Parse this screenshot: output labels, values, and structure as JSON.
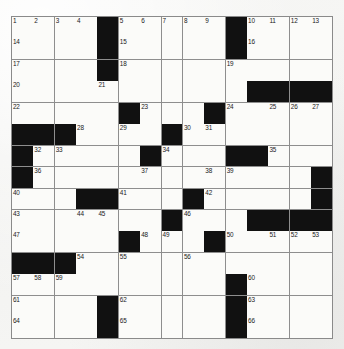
{
  "puzzle": {
    "title": "Crossword Puzzle Grid",
    "type": "american-crossword",
    "size": {
      "rows": 15,
      "cols": 15
    },
    "colors": {
      "block": "#111111",
      "cell": "#fbfbf9",
      "gridline": "#8e8e8e",
      "paper": "#f4f4f2",
      "number": "#1a1a1a"
    },
    "grid": [
      [
        "1",
        "2",
        "3",
        "4",
        "#",
        "5",
        "6",
        "7",
        "8",
        "9",
        "#",
        "10",
        "11",
        "12",
        "13"
      ],
      [
        "14",
        "",
        "",
        "",
        "#",
        "15",
        "",
        "",
        "",
        "",
        "#",
        "16",
        "",
        "",
        ""
      ],
      [
        "17",
        "",
        "",
        "",
        "#",
        "18",
        "",
        "",
        "",
        "",
        "19",
        "",
        "",
        "",
        ""
      ],
      [
        "20",
        "",
        "",
        "",
        "21",
        "",
        "",
        "",
        "",
        "",
        "",
        "#",
        "#",
        "#",
        "#"
      ],
      [
        "22",
        "",
        "",
        "",
        "",
        "#",
        "23",
        "",
        "",
        "#",
        "24",
        "",
        "25",
        "26",
        "27"
      ],
      [
        "#",
        "#",
        "#",
        "28",
        "",
        "29",
        "",
        "#",
        "30",
        "31",
        "",
        "",
        "",
        "",
        ""
      ],
      [
        "#",
        "32",
        "33",
        "",
        "",
        "",
        "#",
        "34",
        "",
        "",
        "#",
        "#",
        "35",
        "",
        ""
      ],
      [
        "#",
        "36",
        "",
        "",
        "",
        "",
        "37",
        "",
        "",
        "38",
        "39",
        "",
        "",
        "",
        "#"
      ],
      [
        "40",
        "",
        "",
        "#",
        "#",
        "41",
        "",
        "",
        "#",
        "42",
        "",
        "",
        "",
        "",
        "#"
      ],
      [
        "43",
        "",
        "",
        "44",
        "45",
        "",
        "",
        "#",
        "46",
        "",
        "",
        "#",
        "#",
        "#",
        "#"
      ],
      [
        "47",
        "",
        "",
        "",
        "",
        "#",
        "48",
        "49",
        "",
        "#",
        "50",
        "",
        "51",
        "52",
        "53"
      ],
      [
        "#",
        "#",
        "#",
        "54",
        "",
        "55",
        "",
        "",
        "56",
        "",
        "",
        "",
        "",
        "",
        ""
      ],
      [
        "57",
        "58",
        "59",
        "",
        "",
        "",
        "",
        "",
        "",
        "",
        "#",
        "60",
        "",
        "",
        ""
      ],
      [
        "61",
        "",
        "",
        "",
        "#",
        "62",
        "",
        "",
        "",
        "",
        "#",
        "63",
        "",
        "",
        ""
      ],
      [
        "64",
        "",
        "",
        "",
        "#",
        "65",
        "",
        "",
        "",
        "",
        "#",
        "66",
        "",
        "",
        ""
      ]
    ],
    "numbers": [
      1,
      2,
      3,
      4,
      5,
      6,
      7,
      8,
      9,
      10,
      11,
      12,
      13,
      14,
      15,
      16,
      17,
      18,
      19,
      20,
      21,
      22,
      23,
      24,
      25,
      26,
      27,
      28,
      29,
      30,
      31,
      32,
      33,
      34,
      35,
      36,
      37,
      38,
      39,
      40,
      41,
      42,
      43,
      44,
      45,
      46,
      47,
      48,
      49,
      50,
      51,
      52,
      53,
      54,
      55,
      56,
      57,
      58,
      59,
      60,
      61,
      62,
      63,
      64,
      65,
      66
    ],
    "block_count": 40,
    "white_count": 185
  }
}
